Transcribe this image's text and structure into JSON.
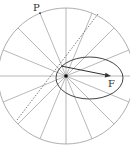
{
  "diagram": {
    "labels": {
      "point_P": "P",
      "point_F": "F"
    },
    "circle": {
      "cx": 66,
      "cy": 76,
      "r": 68,
      "spokes": 16,
      "color": "#9a9a9a"
    },
    "ellipse": {
      "cx": 89.5,
      "cy": 78,
      "rx": 33.5,
      "ry": 21,
      "color": "#444444"
    },
    "arrow": {
      "from": [
        61,
        66
      ],
      "to": [
        111,
        76
      ],
      "color": "#333333"
    },
    "dotted_lines": [
      {
        "from": [
          98,
          14
        ],
        "to": [
          17,
          120
        ]
      }
    ],
    "colors": {
      "stroke_light": "#9a9a9a",
      "stroke_dark": "#333333",
      "background": "#ffffff"
    }
  }
}
